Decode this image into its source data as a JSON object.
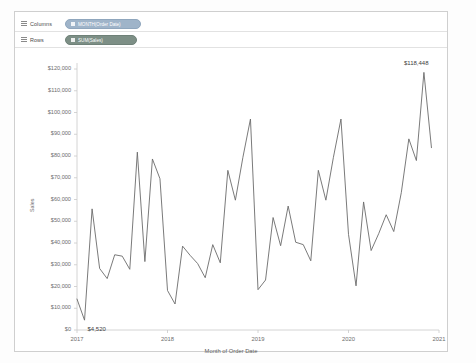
{
  "shelves": {
    "columns": {
      "label": "Columns",
      "pill": "MONTH(Order Date)",
      "icon": "calendar-icon"
    },
    "rows": {
      "label": "Rows",
      "pill": "SUM(Sales)",
      "icon": "measure-icon"
    }
  },
  "chart_data": {
    "type": "line",
    "title": "",
    "xlabel": "Month of Order Date",
    "ylabel": "Sales",
    "grid": false,
    "legend": null,
    "line_color": "#6b6b6b",
    "ylim": [
      0,
      120000
    ],
    "ytick_labels": [
      "$120,000",
      "$110,000",
      "$100,000",
      "$90,000",
      "$80,000",
      "$70,000",
      "$60,000",
      "$50,000",
      "$40,000",
      "$30,000",
      "$20,000",
      "$10,000",
      "$0"
    ],
    "ytick_values": [
      120000,
      110000,
      100000,
      90000,
      80000,
      70000,
      60000,
      50000,
      40000,
      30000,
      20000,
      10000,
      0
    ],
    "xtick_labels": [
      "2017",
      "2018",
      "2019",
      "2020",
      "2021"
    ],
    "xtick_values": [
      0,
      12,
      24,
      36,
      48
    ],
    "annotations": [
      {
        "text": "$118,448",
        "x": 46,
        "y": 118448,
        "name": "max-label"
      },
      {
        "text": "$4,520",
        "x": 1,
        "y": 4520,
        "name": "min-label"
      }
    ],
    "x": [
      0,
      1,
      2,
      3,
      4,
      5,
      6,
      7,
      8,
      9,
      10,
      11,
      12,
      13,
      14,
      15,
      16,
      17,
      18,
      19,
      20,
      21,
      22,
      23,
      24,
      25,
      26,
      27,
      28,
      29,
      30,
      31,
      32,
      33,
      34,
      35,
      36,
      37,
      38,
      39,
      40,
      41,
      42,
      43,
      44,
      45,
      46,
      47
    ],
    "values": [
      14236,
      4520,
      55691,
      28295,
      23648,
      34595,
      33946,
      27909,
      81777,
      31453,
      78629,
      69545,
      18174,
      11951,
      38560,
      34324,
      30540,
      24043,
      39248,
      30889,
      73411,
      59688,
      79412,
      96999,
      18542,
      22979,
      51715,
      38750,
      56987,
      40344,
      39262,
      31816,
      73410,
      59688,
      79412,
      96999,
      43971,
      20301,
      58872,
      36522,
      44261,
      52982,
      45264,
      63121,
      87866,
      77908,
      118448,
      83829
    ],
    "series_name": "Sales"
  }
}
